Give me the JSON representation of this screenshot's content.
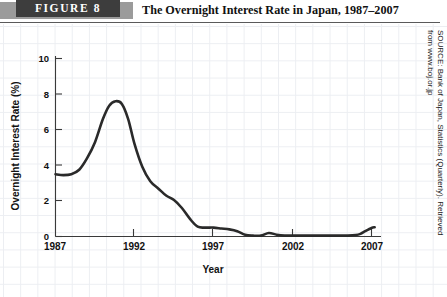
{
  "header": {
    "figure_label": "FIGURE 8",
    "title": "The Overnight Interest Rate in Japan, 1987–2007",
    "banner_color": "#3d3d3d",
    "banner_accent_color": "#9b9b9b"
  },
  "source": {
    "line1": "SOURCE: Bank of Japan, Statistics (Quarterly). Retrieved",
    "line2": "from www.boj.or.jp",
    "full": "SOURCE: Bank of Japan, Statistics (Quarterly). Retrieved from www.boj.or.jp"
  },
  "chart_data": {
    "type": "line",
    "title": "The Overnight Interest Rate in Japan, 1987–2007",
    "xlabel": "Year",
    "ylabel": "Overnight Interest Rate (%)",
    "xlim": [
      1987,
      2007.8
    ],
    "ylim": [
      0,
      10.8
    ],
    "xticks": [
      1987,
      1992,
      1997,
      2002,
      2007
    ],
    "xticklabels": [
      "1987",
      "1992",
      "1997",
      "2002",
      "2007"
    ],
    "yticks": [
      0,
      2,
      4,
      6,
      8,
      10
    ],
    "yticklabels": [
      "0",
      "2",
      "4",
      "6",
      "8",
      "10"
    ],
    "grid": false,
    "legend": null,
    "line_color": "#2a2a2a",
    "series": [
      {
        "name": "Overnight interest rate",
        "x": [
          1987.0,
          1987.5,
          1988.0,
          1988.5,
          1989.0,
          1989.5,
          1990.0,
          1990.4,
          1990.8,
          1991.2,
          1991.6,
          1992.0,
          1992.5,
          1993.0,
          1993.5,
          1994.0,
          1994.5,
          1995.0,
          1995.5,
          1996.0,
          1996.5,
          1997.0,
          1997.5,
          1998.0,
          1998.5,
          1999.0,
          1999.5,
          2000.0,
          2000.5,
          2001.0,
          2001.5,
          2002.0,
          2002.5,
          2003.0,
          2003.5,
          2004.0,
          2004.5,
          2005.0,
          2005.5,
          2006.0,
          2006.3,
          2006.6,
          2007.0,
          2007.2
        ],
        "y": [
          3.5,
          3.45,
          3.5,
          3.75,
          4.4,
          5.3,
          6.6,
          7.35,
          7.6,
          7.45,
          6.6,
          5.2,
          3.9,
          3.1,
          2.7,
          2.3,
          2.05,
          1.6,
          1.0,
          0.55,
          0.5,
          0.5,
          0.45,
          0.4,
          0.3,
          0.1,
          0.05,
          0.05,
          0.2,
          0.1,
          0.05,
          0.05,
          0.05,
          0.05,
          0.05,
          0.05,
          0.05,
          0.05,
          0.05,
          0.08,
          0.15,
          0.3,
          0.48,
          0.52
        ]
      }
    ],
    "annotations": [
      {
        "text": "Peak of approximately 7.6% in 1990–1991"
      },
      {
        "text": "Near-zero interest rates from 1999 onward"
      },
      {
        "text": "Slight rise toward 2007"
      }
    ]
  }
}
